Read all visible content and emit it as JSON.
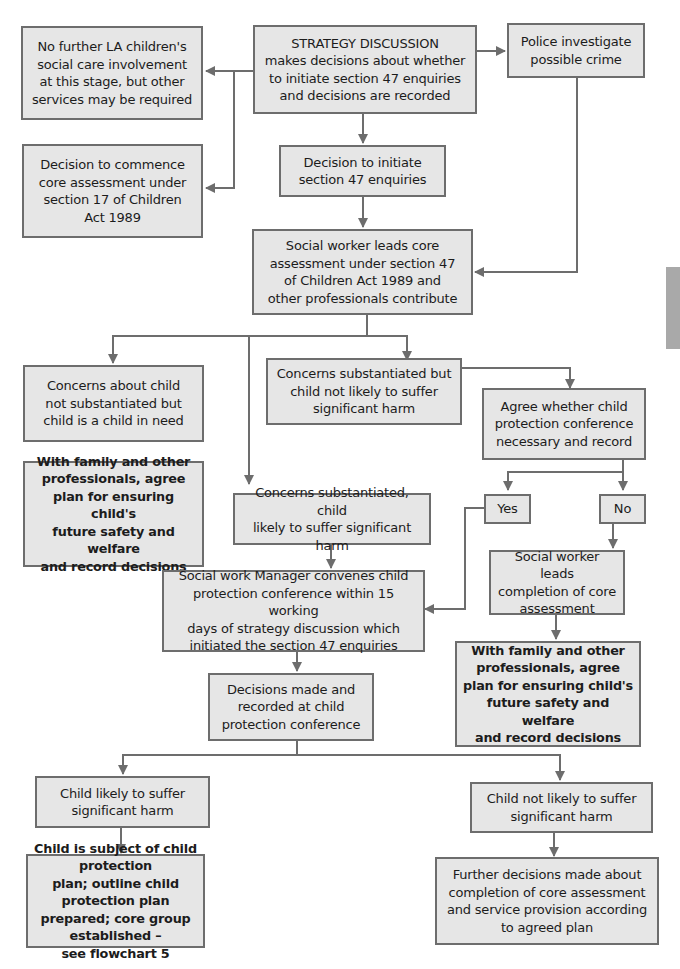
{
  "diagram": {
    "type": "flowchart",
    "colors": {
      "box_fill": "#e6e6e6",
      "box_border": "#6d6d6d",
      "connector": "#6d6d6d",
      "side_tab": "#a9a9a9"
    },
    "nodes": {
      "strategy": {
        "label": "STRATEGY DISCUSSION\nmakes decisions about whether\nto initiate section 47 enquiries\nand decisions are recorded"
      },
      "no_further": {
        "label": "No further LA children's\nsocial care involvement\nat this stage, but other\nservices may be required"
      },
      "police": {
        "label": "Police investigate\npossible crime"
      },
      "core_s17": {
        "label": "Decision to commence\ncore assessment under\nsection 17 of Children\nAct 1989"
      },
      "initiate_s47": {
        "label": "Decision to initiate\nsection 47 enquiries"
      },
      "sw_leads_core": {
        "label": "Social worker leads core\nassessment under section 47\nof Children Act 1989 and\nother professionals contribute"
      },
      "not_substantiated": {
        "label": "Concerns about child\nnot substantiated but\nchild is a child in need"
      },
      "substantiated_not_likely": {
        "label": "Concerns substantiated but\nchild not likely to suffer\nsignificant harm"
      },
      "agree_conference": {
        "label": "Agree whether child\nprotection conference\nnecessary and record"
      },
      "plan_left": {
        "label": "With family and other\nprofessionals, agree\nplan for ensuring child's\nfuture safety and welfare\nand record decisions"
      },
      "substantiated_likely": {
        "label": "Concerns substantiated, child\nlikely to suffer significant harm"
      },
      "yes": {
        "label": "Yes"
      },
      "no": {
        "label": "No"
      },
      "manager_convenes": {
        "label": "Social work Manager convenes child\nprotection conference within 15 working\ndays of strategy discussion which\ninitiated the section 47 enquiries"
      },
      "sw_completion": {
        "label": "Social worker leads\ncompletion of core\nassessment"
      },
      "plan_right": {
        "label": "With family and other\nprofessionals, agree\nplan for ensuring child's\nfuture safety and welfare\nand record decisions"
      },
      "decisions_conference": {
        "label": "Decisions made and\nrecorded at child\nprotection conference"
      },
      "likely_harm": {
        "label": "Child likely to suffer\nsignificant harm"
      },
      "not_likely_harm": {
        "label": "Child not likely to suffer\nsignificant harm"
      },
      "cp_plan": {
        "label": "Child is subject of child protection\nplan; outline child protection plan\nprepared; core group established –\nsee flowchart 5"
      },
      "further_decisions": {
        "label": "Further decisions made about\ncompletion of core assessment\nand service provision according\nto agreed plan"
      }
    },
    "edges": [
      [
        "strategy",
        "no_further"
      ],
      [
        "strategy",
        "core_s17"
      ],
      [
        "strategy",
        "police"
      ],
      [
        "strategy",
        "initiate_s47"
      ],
      [
        "initiate_s47",
        "sw_leads_core"
      ],
      [
        "police",
        "sw_leads_core"
      ],
      [
        "sw_leads_core",
        "not_substantiated"
      ],
      [
        "sw_leads_core",
        "substantiated_not_likely"
      ],
      [
        "sw_leads_core",
        "substantiated_likely"
      ],
      [
        "not_substantiated",
        "plan_left"
      ],
      [
        "substantiated_not_likely",
        "agree_conference"
      ],
      [
        "agree_conference",
        "yes"
      ],
      [
        "agree_conference",
        "no"
      ],
      [
        "yes",
        "manager_convenes"
      ],
      [
        "no",
        "sw_completion"
      ],
      [
        "sw_completion",
        "plan_right"
      ],
      [
        "substantiated_likely",
        "manager_convenes"
      ],
      [
        "manager_convenes",
        "decisions_conference"
      ],
      [
        "decisions_conference",
        "likely_harm"
      ],
      [
        "decisions_conference",
        "not_likely_harm"
      ],
      [
        "likely_harm",
        "cp_plan"
      ],
      [
        "not_likely_harm",
        "further_decisions"
      ]
    ]
  }
}
